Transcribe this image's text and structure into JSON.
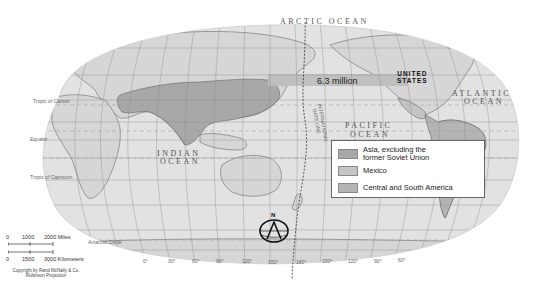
{
  "map": {
    "projection": "Robinson Projection",
    "labels": {
      "arctic_ocean": "ARCTIC OCEAN",
      "atlantic_ocean_1": "ATLANTIC",
      "atlantic_ocean_2": "OCEAN",
      "pacific_ocean_1": "PACIFIC",
      "pacific_ocean_2": "OCEAN",
      "indian_ocean_1": "INDIAN",
      "indian_ocean_2": "OCEAN",
      "united_states_1": "UNITED",
      "united_states_2": "STATES",
      "date_line_1": "INTERNATIONAL",
      "date_line_2": "DATE LINE",
      "tropic_of_cancer": "Tropic of Cancer",
      "tropic_of_capricorn": "Tropic of Capricorn",
      "equator": "Equator",
      "antarctic_circle": "Antarctic Circle",
      "compass_north": "N"
    },
    "flow_label": "6.3 million",
    "latitude_labels": [
      "60°",
      "30°",
      "15°",
      "0°",
      "15°",
      "30°",
      "60°"
    ],
    "longitude_labels": [
      "0°",
      "30°",
      "60°",
      "90°",
      "120°",
      "150°",
      "180°",
      "150°",
      "120°",
      "90°",
      "60°"
    ],
    "colors": {
      "land": "#d6d6d6",
      "ocean": "#e2e2e2",
      "asia_region": "#a8a8a8",
      "mexico_region": "#c4c4c4",
      "central_south_america_region": "#b4b4b4",
      "flow_band": "#bdbdbd",
      "grid": "#8a8a8a",
      "background": "#ffffff"
    }
  },
  "legend": {
    "items": [
      {
        "label_1": "Asia, excluding the",
        "label_2": "former Soviet Union",
        "color": "#a8a8a8"
      },
      {
        "label_1": "Mexico",
        "label_2": "",
        "color": "#c4c4c4"
      },
      {
        "label_1": "Central and South America",
        "label_2": "",
        "color": "#b4b4b4"
      }
    ]
  },
  "scale_bar": {
    "miles_ticks": [
      "0",
      "1000",
      "2000 Miles"
    ],
    "km_ticks": [
      "0",
      "1500",
      "3000 Kilometers"
    ],
    "copyright_1": "Copyright by Rand McNally & Co.",
    "copyright_2": "Robinson Projection"
  }
}
